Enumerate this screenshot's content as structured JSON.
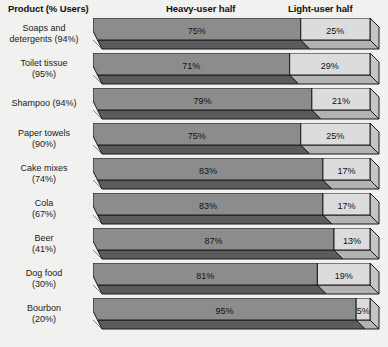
{
  "header": {
    "product_label": "Product (% Users)",
    "heavy_label": "Heavy-user half",
    "light_label": "Light-user half"
  },
  "colors": {
    "background": "#f2f2f0",
    "heavy_top": "#8d8d8d",
    "heavy_side": "#5c5c5c",
    "heavy_cap": "#6e6e6e",
    "light_top": "#dddddd",
    "light_side": "#b4b4b4",
    "light_cap": "#c6c6c6",
    "outline": "#1a1a1a",
    "text": "#1a1a1a"
  },
  "chart_data": {
    "type": "bar",
    "subtype": "stacked-horizontal-3d",
    "title": "",
    "xlabel": "",
    "ylabel": "Product (% Users)",
    "xlim": [
      0,
      100
    ],
    "grid": false,
    "legend_position": "top",
    "legend": [
      "Heavy-user half",
      "Light-user half"
    ],
    "categories": [
      "Soaps and\ndetergents (94%)",
      "Toilet tissue\n(95%)",
      "Shampoo (94%)",
      "Paper towels\n(90%)",
      "Cake mixes\n(74%)",
      "Cola\n(67%)",
      "Beer\n(41%)",
      "Dog food\n(30%)",
      "Bourbon\n(20%)"
    ],
    "products": [
      "Soaps and detergents",
      "Toilet tissue",
      "Shampoo",
      "Paper towels",
      "Cake mixes",
      "Cola",
      "Beer",
      "Dog food",
      "Bourbon"
    ],
    "percent_users": [
      94,
      95,
      94,
      90,
      74,
      67,
      41,
      30,
      20
    ],
    "percent_users_labels": [
      "94%",
      "95%",
      "94%",
      "90%",
      "74%",
      "67%",
      "41%",
      "30%",
      "20%"
    ],
    "series": [
      {
        "name": "Heavy-user half",
        "values": [
          75,
          71,
          79,
          75,
          83,
          83,
          87,
          81,
          95
        ],
        "labels": [
          "75%",
          "71%",
          "79%",
          "75%",
          "83%",
          "83%",
          "87%",
          "81%",
          "95%"
        ]
      },
      {
        "name": "Light-user half",
        "values": [
          25,
          29,
          21,
          25,
          17,
          17,
          13,
          19,
          5
        ],
        "labels": [
          "25%",
          "29%",
          "21%",
          "25%",
          "17%",
          "17%",
          "13%",
          "19%",
          "5%"
        ]
      }
    ]
  }
}
